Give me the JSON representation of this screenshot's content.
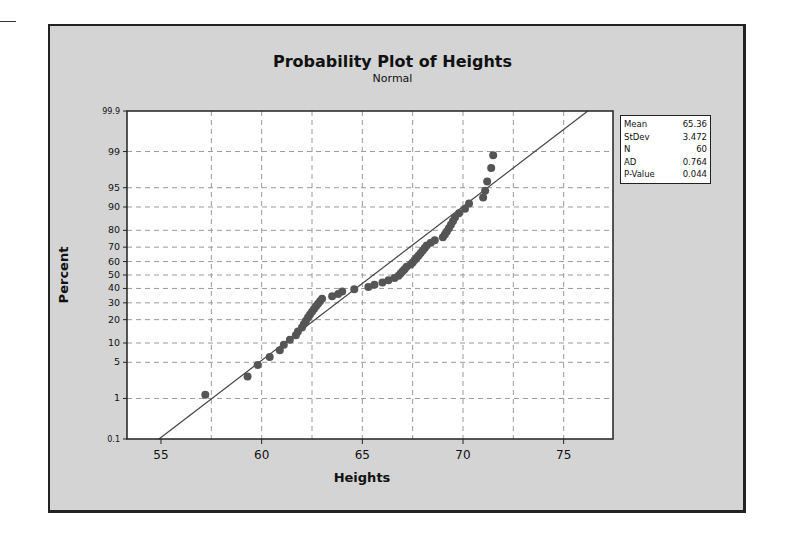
{
  "chart_data": {
    "type": "scatter",
    "title": "Probability Plot of Heights",
    "subtitle": "Normal",
    "xlabel": "Heights",
    "ylabel": "Percent",
    "xlim": [
      53,
      77.5
    ],
    "ylim": [
      0.1,
      99.9
    ],
    "x_ticks": [
      55,
      60,
      65,
      70,
      75
    ],
    "x_gridlines": [
      57.5,
      60,
      62.5,
      65,
      67.5,
      70,
      72.5,
      75
    ],
    "y_ticks": [
      0.1,
      1,
      5,
      10,
      20,
      30,
      40,
      50,
      60,
      70,
      80,
      90,
      95,
      99,
      99.9
    ],
    "y_tick_labels": [
      "0.1",
      "1",
      "5",
      "10",
      "20",
      "30",
      "40",
      "50",
      "60",
      "70",
      "80",
      "90",
      "95",
      "99",
      "99.9"
    ],
    "y_scale": "normal-probability",
    "grid": true,
    "fit_line": {
      "from": [
        54.9,
        0.1
      ],
      "to": [
        76.2,
        99.9
      ],
      "label": "Normal fit (Mean 65.36, StDev 3.472)"
    },
    "points": [
      {
        "x": 57.2,
        "y": 1.2
      },
      {
        "x": 59.3,
        "y": 2.8
      },
      {
        "x": 59.8,
        "y": 4.5
      },
      {
        "x": 60.4,
        "y": 6.1
      },
      {
        "x": 60.9,
        "y": 7.8
      },
      {
        "x": 61.1,
        "y": 9.4
      },
      {
        "x": 61.4,
        "y": 11.1
      },
      {
        "x": 61.7,
        "y": 12.8
      },
      {
        "x": 61.8,
        "y": 14.4
      },
      {
        "x": 62.0,
        "y": 16.1
      },
      {
        "x": 62.1,
        "y": 17.8
      },
      {
        "x": 62.2,
        "y": 19.4
      },
      {
        "x": 62.3,
        "y": 21.1
      },
      {
        "x": 62.4,
        "y": 22.8
      },
      {
        "x": 62.5,
        "y": 24.4
      },
      {
        "x": 62.6,
        "y": 26.1
      },
      {
        "x": 62.7,
        "y": 27.8
      },
      {
        "x": 62.8,
        "y": 29.4
      },
      {
        "x": 62.9,
        "y": 31.1
      },
      {
        "x": 63.0,
        "y": 32.8
      },
      {
        "x": 63.5,
        "y": 34.4
      },
      {
        "x": 63.8,
        "y": 36.1
      },
      {
        "x": 64.0,
        "y": 37.8
      },
      {
        "x": 64.6,
        "y": 39.4
      },
      {
        "x": 65.3,
        "y": 41.1
      },
      {
        "x": 65.6,
        "y": 42.8
      },
      {
        "x": 66.0,
        "y": 44.4
      },
      {
        "x": 66.3,
        "y": 46.1
      },
      {
        "x": 66.6,
        "y": 47.8
      },
      {
        "x": 66.8,
        "y": 49.4
      },
      {
        "x": 66.9,
        "y": 51.1
      },
      {
        "x": 67.0,
        "y": 52.8
      },
      {
        "x": 67.1,
        "y": 54.4
      },
      {
        "x": 67.2,
        "y": 56.1
      },
      {
        "x": 67.4,
        "y": 57.8
      },
      {
        "x": 67.5,
        "y": 59.4
      },
      {
        "x": 67.6,
        "y": 61.1
      },
      {
        "x": 67.7,
        "y": 62.8
      },
      {
        "x": 67.8,
        "y": 64.4
      },
      {
        "x": 67.9,
        "y": 66.1
      },
      {
        "x": 68.0,
        "y": 67.8
      },
      {
        "x": 68.1,
        "y": 69.4
      },
      {
        "x": 68.2,
        "y": 71.1
      },
      {
        "x": 68.4,
        "y": 72.8
      },
      {
        "x": 68.6,
        "y": 74.4
      },
      {
        "x": 69.0,
        "y": 76.1
      },
      {
        "x": 69.1,
        "y": 77.8
      },
      {
        "x": 69.2,
        "y": 79.4
      },
      {
        "x": 69.3,
        "y": 81.1
      },
      {
        "x": 69.4,
        "y": 82.8
      },
      {
        "x": 69.5,
        "y": 84.4
      },
      {
        "x": 69.6,
        "y": 86.1
      },
      {
        "x": 69.8,
        "y": 87.8
      },
      {
        "x": 70.1,
        "y": 89.4
      },
      {
        "x": 70.3,
        "y": 91.1
      },
      {
        "x": 71.0,
        "y": 92.8
      },
      {
        "x": 71.1,
        "y": 94.4
      },
      {
        "x": 71.2,
        "y": 96.1
      },
      {
        "x": 71.4,
        "y": 97.8
      },
      {
        "x": 71.5,
        "y": 98.8
      }
    ],
    "legend": {
      "position": "right",
      "entries": [
        {
          "label": "Mean",
          "value": "65.36"
        },
        {
          "label": "StDev",
          "value": "3.472"
        },
        {
          "label": "N",
          "value": "60"
        },
        {
          "label": "AD",
          "value": "0.764"
        },
        {
          "label": "P-Value",
          "value": "0.044"
        }
      ]
    }
  },
  "colors": {
    "frame_bg": "#d4d4d4",
    "plot_bg": "#ffffff",
    "grid": "#9a9a9a",
    "point": "#555555",
    "fit_line": "#444444"
  }
}
